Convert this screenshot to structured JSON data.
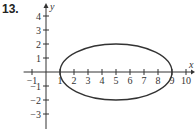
{
  "problem": {
    "number": "13."
  },
  "chart_data": {
    "type": "line",
    "title": "",
    "xlabel": "x",
    "ylabel": "y",
    "xlim": [
      -1,
      10
    ],
    "ylim": [
      -3,
      4
    ],
    "x_ticks": [
      "-1",
      "1",
      "2",
      "3",
      "4",
      "5",
      "6",
      "7",
      "8",
      "9",
      "10"
    ],
    "y_ticks": [
      "4",
      "3",
      "2",
      "1",
      "-1",
      "-2",
      "-3"
    ],
    "grid": false,
    "series": [
      {
        "name": "ellipse",
        "shape": "ellipse",
        "center": [
          5,
          0
        ],
        "semi_major_x": 4,
        "semi_minor_y": 2,
        "equation": "(x-5)^2/16 + y^2/4 = 1",
        "x_intercepts": [
          1,
          9
        ],
        "y_extent": [
          -2,
          2
        ]
      }
    ]
  }
}
